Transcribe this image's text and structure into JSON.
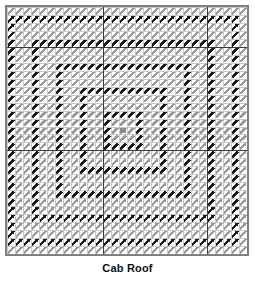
{
  "figure": {
    "caption": "Cab Roof",
    "plot_type": "vector-field-grid",
    "frame_border_color": "#808080",
    "minor_grid_color": "#c8c8c8",
    "major_grid_color": "#3a3a3a",
    "background": "#ffffff"
  },
  "chart_data": {
    "type": "heatmap",
    "title": "Cab Roof",
    "subtitle": "",
    "xlabel": "",
    "ylabel": "",
    "legend": [],
    "annotations": [],
    "grid": true,
    "grid_columns": 30,
    "grid_rows": 31,
    "major_gridlines_x": [
      12,
      25
    ],
    "major_gridlines_y": [
      5,
      18
    ],
    "arrow_direction_deg": 45,
    "arrow_colors": {
      "low": "#9a9a9a",
      "high": "#1a1a1a",
      "center_marker": "#8c8c8c"
    },
    "center_marker": {
      "col": 14,
      "row": 15
    },
    "ring_radii_dark": [
      2,
      5,
      8,
      11,
      14
    ],
    "categories": [
      "ring-1",
      "ring-2",
      "ring-3",
      "ring-4",
      "ring-5"
    ],
    "values": [
      2,
      5,
      8,
      11,
      14
    ],
    "xlim": [
      0,
      30
    ],
    "ylim": [
      0,
      31
    ]
  }
}
